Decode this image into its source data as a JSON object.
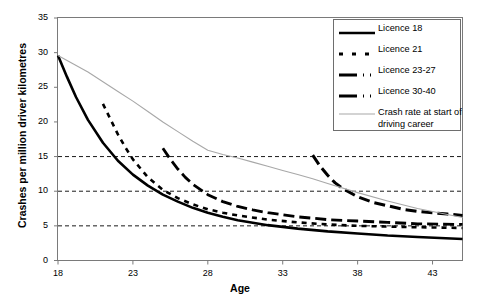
{
  "chart_data": {
    "type": "line",
    "title": "",
    "xlabel": "Age",
    "ylabel": "Crashes per million driver kilometres",
    "xlim": [
      18,
      45
    ],
    "ylim": [
      0,
      35
    ],
    "xticks": [
      18,
      23,
      28,
      33,
      38,
      43
    ],
    "yticks": [
      0,
      5,
      10,
      15,
      20,
      25,
      30,
      35
    ],
    "grid": "horizontal dashed at 5, 10, 15",
    "gridlines": [
      5,
      10,
      15
    ],
    "legend_position": "top-right inside plot",
    "series": [
      {
        "name": "Licence 18",
        "style": "solid",
        "color": "#000000",
        "width": 2.6,
        "x": [
          18,
          18.6,
          19.2,
          20,
          21,
          22,
          23,
          24,
          25,
          26,
          27,
          28,
          29,
          30,
          32,
          34,
          36,
          38,
          40,
          42,
          45
        ],
        "y": [
          29.6,
          26.5,
          23.6,
          20.3,
          17.0,
          14.4,
          12.4,
          10.8,
          9.5,
          8.5,
          7.6,
          6.9,
          6.3,
          5.8,
          5.1,
          4.6,
          4.2,
          3.9,
          3.6,
          3.4,
          3.1
        ]
      },
      {
        "name": "Licence 21",
        "style": "dotted-dashed",
        "color": "#000000",
        "width": 2.6,
        "x": [
          21,
          21.5,
          22,
          22.5,
          23,
          24,
          25,
          26,
          27,
          28,
          29,
          30,
          32,
          34,
          36,
          38,
          40,
          42,
          45
        ],
        "y": [
          22.6,
          20.4,
          18.2,
          16.3,
          14.6,
          12.0,
          10.2,
          9.0,
          8.1,
          7.4,
          6.9,
          6.5,
          5.9,
          5.5,
          5.2,
          5.0,
          4.9,
          4.8,
          4.7
        ]
      },
      {
        "name": "Licence 23-27",
        "style": "long-dash",
        "color": "#000000",
        "width": 2.8,
        "x": [
          25,
          25.5,
          26,
          26.5,
          27,
          28,
          29,
          30,
          31,
          32,
          33,
          34,
          36,
          38,
          40,
          42,
          45
        ],
        "y": [
          16.2,
          14.6,
          13.2,
          12.0,
          11.0,
          9.5,
          8.5,
          7.8,
          7.3,
          6.9,
          6.6,
          6.3,
          5.9,
          5.7,
          5.5,
          5.3,
          5.2
        ]
      },
      {
        "name": "Licence 30-40",
        "style": "long-dash",
        "color": "#000000",
        "width": 3.0,
        "x": [
          35,
          35.5,
          36,
          36.5,
          37,
          38,
          39,
          40,
          41,
          42,
          43,
          44,
          45
        ],
        "y": [
          15.2,
          13.6,
          12.3,
          11.2,
          10.4,
          9.2,
          8.4,
          7.9,
          7.4,
          7.1,
          6.9,
          6.7,
          6.5
        ]
      },
      {
        "name": "Crash rate at start of driving career",
        "style": "thin-solid",
        "color": "#a8a8a8",
        "width": 1.1,
        "x": [
          18,
          19,
          20,
          21,
          22,
          23,
          24,
          25,
          26,
          27,
          28,
          29,
          30,
          31,
          32,
          33,
          34,
          35,
          36,
          38,
          40,
          42,
          45
        ],
        "y": [
          29.6,
          28.4,
          27.2,
          25.8,
          24.4,
          23.0,
          21.5,
          20.0,
          18.6,
          17.2,
          15.9,
          15.3,
          14.8,
          14.2,
          13.6,
          13.0,
          12.4,
          11.8,
          11.1,
          9.8,
          8.6,
          7.5,
          6.2
        ]
      }
    ]
  },
  "axes": {
    "y_title": "Crashes per million driver kilometres",
    "x_title": "Age",
    "y_labels": [
      "35",
      "30",
      "25",
      "20",
      "15",
      "10",
      "5",
      "0"
    ],
    "x_labels": [
      "18",
      "23",
      "28",
      "33",
      "38",
      "43"
    ]
  },
  "legend": {
    "items": [
      {
        "label": "Licence 18",
        "sample": "solid-line-sample"
      },
      {
        "label": "Licence 21",
        "sample": "dashed-line-sample"
      },
      {
        "label": "Licence 23-27",
        "sample": "long-dash-line-sample"
      },
      {
        "label": "Licence 30-40",
        "sample": "long-dash-line-sample"
      },
      {
        "label": "Crash rate at start of driving career",
        "sample": "thin-grey-line-sample"
      }
    ]
  },
  "colors": {
    "series_black": "#000000",
    "series_grey": "#a8a8a8",
    "frame": "#7a7a7a",
    "grid": "#000000",
    "background": "#ffffff"
  }
}
